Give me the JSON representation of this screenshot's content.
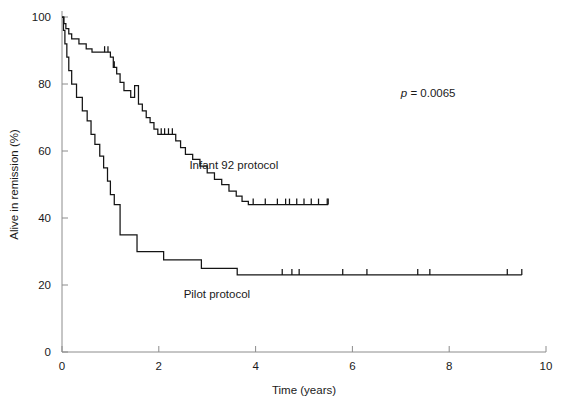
{
  "chart_data": {
    "type": "line",
    "title": "",
    "subtitle": "",
    "xlabel": "Time (years)",
    "ylabel": "Alive in remission (%)",
    "xlim": [
      0,
      10
    ],
    "ylim": [
      0,
      100
    ],
    "xticks": [
      0,
      2,
      4,
      6,
      8,
      10
    ],
    "xtick_labels": [
      "0",
      "2",
      "4",
      "6",
      "8",
      "10"
    ],
    "yticks": [
      0,
      20,
      40,
      60,
      80,
      100
    ],
    "ytick_labels": [
      "0",
      "20",
      "40",
      "60",
      "80",
      "100"
    ],
    "grid": false,
    "legend_position": "inline-annotation",
    "annotations": [
      {
        "name": "p-value",
        "text_italic": "p",
        "text": " = 0.0065",
        "full_text": "p = 0.0065",
        "x": 7.0,
        "y": 76
      }
    ],
    "series": [
      {
        "name": "Infant 92 protocol",
        "label": "Infant 92 protocol",
        "color": "#141414",
        "label_x": 3.55,
        "label_y": 54.5,
        "plateau_value": 44,
        "last_time": 5.5,
        "steps": [
          [
            0.0,
            100
          ],
          [
            0.04,
            100
          ],
          [
            0.04,
            98
          ],
          [
            0.08,
            98
          ],
          [
            0.08,
            96.5
          ],
          [
            0.14,
            96.5
          ],
          [
            0.14,
            95
          ],
          [
            0.2,
            95
          ],
          [
            0.2,
            93.5
          ],
          [
            0.35,
            93.5
          ],
          [
            0.35,
            92
          ],
          [
            0.5,
            92
          ],
          [
            0.5,
            90.5
          ],
          [
            0.62,
            90.5
          ],
          [
            0.62,
            89.5
          ],
          [
            1.0,
            89.5
          ],
          [
            1.0,
            88
          ],
          [
            1.06,
            88
          ],
          [
            1.06,
            85
          ],
          [
            1.13,
            85
          ],
          [
            1.13,
            83
          ],
          [
            1.2,
            83
          ],
          [
            1.2,
            80.5
          ],
          [
            1.28,
            80.5
          ],
          [
            1.28,
            78
          ],
          [
            1.42,
            78
          ],
          [
            1.42,
            76
          ],
          [
            1.5,
            76
          ],
          [
            1.5,
            79.5
          ],
          [
            1.58,
            79.5
          ],
          [
            1.58,
            74
          ],
          [
            1.66,
            74
          ],
          [
            1.66,
            72
          ],
          [
            1.74,
            72
          ],
          [
            1.74,
            70
          ],
          [
            1.82,
            70
          ],
          [
            1.82,
            68.5
          ],
          [
            1.9,
            68.5
          ],
          [
            1.9,
            66.5
          ],
          [
            1.98,
            66.5
          ],
          [
            1.98,
            65
          ],
          [
            2.35,
            65
          ],
          [
            2.35,
            63
          ],
          [
            2.45,
            63
          ],
          [
            2.45,
            61
          ],
          [
            2.55,
            61
          ],
          [
            2.55,
            59
          ],
          [
            2.7,
            59
          ],
          [
            2.7,
            57.5
          ],
          [
            2.85,
            57.5
          ],
          [
            2.85,
            55.5
          ],
          [
            3.0,
            55.5
          ],
          [
            3.0,
            53.5
          ],
          [
            3.15,
            53.5
          ],
          [
            3.15,
            51.5
          ],
          [
            3.3,
            51.5
          ],
          [
            3.3,
            50
          ],
          [
            3.45,
            50
          ],
          [
            3.45,
            48
          ],
          [
            3.6,
            48
          ],
          [
            3.6,
            46.5
          ],
          [
            3.72,
            46.5
          ],
          [
            3.72,
            45
          ],
          [
            3.85,
            45
          ],
          [
            3.85,
            44
          ],
          [
            5.5,
            44
          ]
        ],
        "censor_times": [
          0.88,
          0.95,
          1.08,
          2.05,
          2.12,
          2.2,
          2.28,
          3.95,
          4.2,
          4.45,
          4.62,
          4.7,
          4.85,
          5.0,
          5.15,
          5.3,
          5.48
        ]
      },
      {
        "name": "Pilot protocol",
        "label": "Pilot protocol",
        "color": "#141414",
        "label_x": 3.2,
        "label_y": 16,
        "plateau_value": 23,
        "last_time": 9.5,
        "steps": [
          [
            0.0,
            100
          ],
          [
            0.03,
            100
          ],
          [
            0.03,
            96
          ],
          [
            0.06,
            96
          ],
          [
            0.06,
            92
          ],
          [
            0.1,
            92
          ],
          [
            0.1,
            88
          ],
          [
            0.14,
            88
          ],
          [
            0.14,
            84
          ],
          [
            0.2,
            84
          ],
          [
            0.2,
            80
          ],
          [
            0.3,
            80
          ],
          [
            0.3,
            76
          ],
          [
            0.42,
            76
          ],
          [
            0.42,
            72
          ],
          [
            0.52,
            72
          ],
          [
            0.52,
            69
          ],
          [
            0.6,
            69
          ],
          [
            0.6,
            65
          ],
          [
            0.68,
            65
          ],
          [
            0.68,
            62
          ],
          [
            0.78,
            62
          ],
          [
            0.78,
            58.5
          ],
          [
            0.86,
            58.5
          ],
          [
            0.86,
            55
          ],
          [
            0.94,
            55
          ],
          [
            0.94,
            51
          ],
          [
            1.0,
            51
          ],
          [
            1.0,
            47
          ],
          [
            1.08,
            47
          ],
          [
            1.08,
            44
          ],
          [
            1.2,
            44
          ],
          [
            1.2,
            35
          ],
          [
            1.55,
            35
          ],
          [
            1.55,
            30
          ],
          [
            2.1,
            30
          ],
          [
            2.1,
            27.5
          ],
          [
            2.88,
            27.5
          ],
          [
            2.88,
            25
          ],
          [
            3.62,
            25
          ],
          [
            3.62,
            23
          ],
          [
            9.5,
            23
          ]
        ],
        "censor_times": [
          4.55,
          4.75,
          4.9,
          5.8,
          6.3,
          7.35,
          7.6,
          9.2
        ]
      }
    ]
  },
  "figure": {
    "axis_color": "#8c8c8c",
    "curve_color": "#141414",
    "background": "#ffffff"
  }
}
